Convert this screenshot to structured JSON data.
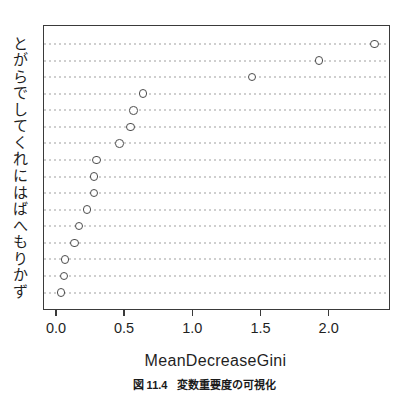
{
  "figure": {
    "xlabel": "MeanDecreaseGini",
    "caption": {
      "label": "図 11.4",
      "text": "変数重要度の可視化"
    }
  },
  "chart_data": {
    "type": "scatter",
    "subtype": "cleveland-dot-plot",
    "title": "",
    "xlabel": "MeanDecreaseGini",
    "ylabel": "",
    "categories": [
      "と",
      "が",
      "ら",
      "で",
      "し",
      "て",
      "く",
      "れ",
      "に",
      "は",
      "ば",
      "へ",
      "も",
      "り",
      "か",
      "ず"
    ],
    "values": [
      2.33,
      1.92,
      1.43,
      0.63,
      0.56,
      0.54,
      0.46,
      0.29,
      0.27,
      0.27,
      0.22,
      0.16,
      0.13,
      0.06,
      0.05,
      0.03
    ],
    "x_ticks": [
      0,
      0.5,
      1,
      1.5,
      2
    ],
    "x_tick_labels": [
      "0.0",
      "0.5",
      "1.0",
      "1.5",
      "2.0"
    ],
    "xlim": [
      -0.095,
      2.435
    ],
    "grid": "horizontal-dotted",
    "legend": "none",
    "point_style": "open-circle",
    "caption": "図 11.4 変数重要度の可視化",
    "colors": {
      "point_stroke": "#4d4d4d",
      "grid_dot": "#cfcfcf",
      "frame": "#3a3a3a",
      "text": "#1f1f1f",
      "background": "#ffffff"
    }
  }
}
